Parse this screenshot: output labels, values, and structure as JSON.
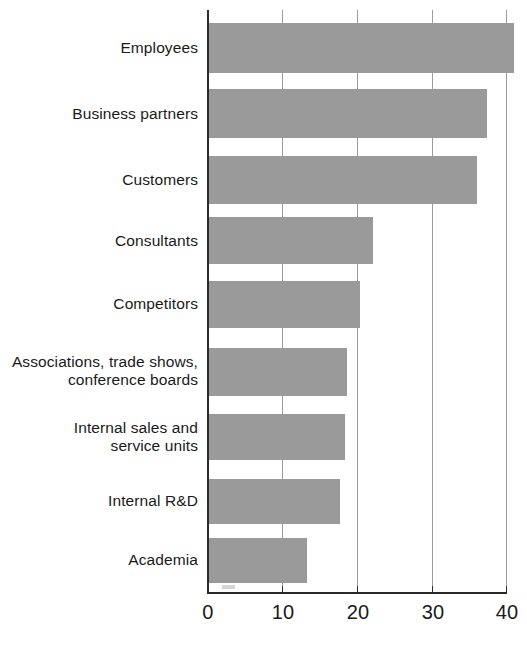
{
  "chart_data": {
    "type": "bar",
    "orientation": "horizontal",
    "title": "",
    "subtitle": "",
    "xlabel": "",
    "ylabel": "",
    "xlim": [
      0,
      41.5
    ],
    "xticks": [
      0,
      10,
      20,
      30,
      40
    ],
    "xtick_labels": [
      "0",
      "10",
      "20",
      "30",
      "40"
    ],
    "grid": "vertical",
    "legend": "none",
    "bar_color": "#9a9a9a",
    "axis_color": "#2b2b2b",
    "grid_color": "#9c9c9c",
    "background": "#ffffff",
    "categories": [
      "Employees",
      "Business partners",
      "Customers",
      "Consultants",
      "Competitors",
      "Associations, trade shows, conference boards",
      "Internal sales and service units",
      "Internal R&D",
      "Academia"
    ],
    "category_lines": [
      [
        "Employees"
      ],
      [
        "Business partners"
      ],
      [
        "Customers"
      ],
      [
        "Consultants"
      ],
      [
        "Competitors"
      ],
      [
        "Associations, trade shows,",
        "conference boards"
      ],
      [
        "Internal sales and",
        "service units"
      ],
      [
        "Internal R&D"
      ],
      [
        "Academia"
      ]
    ],
    "values": [
      41,
      37.4,
      36.1,
      22.1,
      20.3,
      18.5,
      18.3,
      17.6,
      13.2
    ]
  }
}
